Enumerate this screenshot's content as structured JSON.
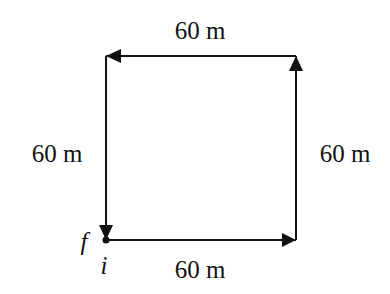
{
  "diagram": {
    "type": "displacement-path",
    "shape": "square",
    "segments": [
      {
        "id": "bottom",
        "direction": "right",
        "label": "60 m"
      },
      {
        "id": "right",
        "direction": "up",
        "label": "60 m"
      },
      {
        "id": "top",
        "direction": "left",
        "label": "60 m"
      },
      {
        "id": "left",
        "direction": "down",
        "label": "60 m"
      }
    ],
    "points": {
      "initial": "i",
      "final": "f"
    },
    "colors": {
      "stroke": "#111111",
      "background": "#ffffff"
    }
  }
}
